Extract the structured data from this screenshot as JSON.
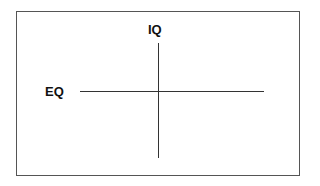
{
  "diagram": {
    "type": "quadrant-axes",
    "vertical_axis_label": "IQ",
    "horizontal_axis_label": "EQ",
    "colors": {
      "line": "#333333",
      "border": "#555555",
      "text": "#111111",
      "background": "#ffffff"
    }
  }
}
